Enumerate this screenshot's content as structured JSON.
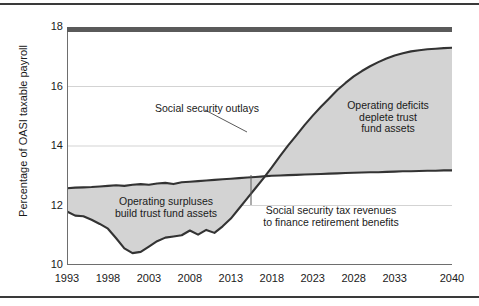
{
  "chart_data": {
    "type": "area",
    "title": "",
    "subtitle": "",
    "xlabel": "",
    "ylabel": "Percentage of OASI taxable payroll",
    "xlim": [
      1993,
      2040
    ],
    "ylim": [
      10,
      18
    ],
    "grid": true,
    "legend_position": "none",
    "xticks": [
      "1993",
      "1998",
      "2003",
      "2008",
      "2013",
      "2018",
      "2023",
      "2028",
      "2033",
      "2040"
    ],
    "xtick_values": [
      1993,
      1998,
      2003,
      2008,
      2013,
      2018,
      2023,
      2028,
      2033,
      2040
    ],
    "yticks": [
      "10",
      "12",
      "14",
      "16",
      "18"
    ],
    "ytick_values": [
      10,
      12,
      14,
      16,
      18
    ],
    "x": [
      1993,
      1994,
      1995,
      1996,
      1997,
      1998,
      1999,
      2000,
      2001,
      2002,
      2003,
      2004,
      2005,
      2006,
      2007,
      2008,
      2009,
      2010,
      2011,
      2012,
      2013,
      2014,
      2015,
      2016,
      2017,
      2018,
      2019,
      2020,
      2021,
      2022,
      2023,
      2024,
      2025,
      2026,
      2027,
      2028,
      2029,
      2030,
      2031,
      2032,
      2033,
      2034,
      2035,
      2036,
      2037,
      2038,
      2039,
      2040
    ],
    "series": [
      {
        "name": "Social security tax revenues to finance retirement benefits",
        "role": "revenues",
        "color": "#333333",
        "values": [
          12.58,
          12.6,
          12.61,
          12.62,
          12.64,
          12.66,
          12.68,
          12.66,
          12.7,
          12.72,
          12.7,
          12.74,
          12.76,
          12.72,
          12.78,
          12.8,
          12.82,
          12.84,
          12.86,
          12.88,
          12.9,
          12.92,
          12.94,
          12.96,
          12.98,
          13.0,
          13.01,
          13.02,
          13.03,
          13.04,
          13.05,
          13.06,
          13.07,
          13.08,
          13.09,
          13.1,
          13.11,
          13.12,
          13.12,
          13.13,
          13.14,
          13.15,
          13.15,
          13.16,
          13.17,
          13.17,
          13.18,
          13.18
        ]
      },
      {
        "name": "Social security outlays",
        "role": "outlays",
        "color": "#333333",
        "values": [
          11.8,
          11.66,
          11.64,
          11.52,
          11.38,
          11.22,
          10.9,
          10.56,
          10.4,
          10.44,
          10.62,
          10.8,
          10.92,
          10.96,
          11.0,
          11.16,
          11.02,
          11.18,
          11.08,
          11.3,
          11.56,
          11.9,
          12.24,
          12.58,
          12.92,
          13.28,
          13.66,
          14.02,
          14.36,
          14.7,
          15.02,
          15.32,
          15.6,
          15.88,
          16.12,
          16.34,
          16.52,
          16.68,
          16.82,
          16.94,
          17.04,
          17.12,
          17.18,
          17.22,
          17.25,
          17.27,
          17.29,
          17.3
        ]
      }
    ],
    "fill_color": "#d3d3d3",
    "crossover_year": 2017,
    "annotations": [
      {
        "name": "operating-surpluses",
        "text": "Operating surpluses\nbuild trust fund assets"
      },
      {
        "name": "social-security-outlays",
        "text": "Social security outlays"
      },
      {
        "name": "operating-deficits",
        "text": "Operating deficits\ndeplete trust\nfund assets"
      },
      {
        "name": "social-security-tax-revenues",
        "text": "Social security tax revenues\nto finance retirement benefits"
      }
    ]
  }
}
